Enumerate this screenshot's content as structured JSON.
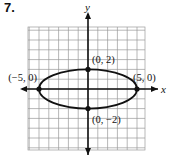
{
  "problem_number": "7.",
  "chart_data": {
    "type": "line",
    "title": "",
    "xlabel": "x",
    "ylabel": "y",
    "xlim": [
      -6,
      6
    ],
    "ylim": [
      -6,
      6
    ],
    "grid": true,
    "curve": "ellipse",
    "equation_params": {
      "center": [
        0,
        0
      ],
      "a": 5,
      "b": 2
    },
    "points": [
      {
        "x": 0,
        "y": 2,
        "label": "(0, 2)"
      },
      {
        "x": 0,
        "y": -2,
        "label": "(0, −2)"
      },
      {
        "x": -5,
        "y": 0,
        "label": "(−5, 0)"
      },
      {
        "x": 5,
        "y": 0,
        "label": "(5, 0)"
      }
    ]
  },
  "colors": {
    "grid": "#9a9a9a",
    "axis": "#111111",
    "curve": "#111111"
  }
}
